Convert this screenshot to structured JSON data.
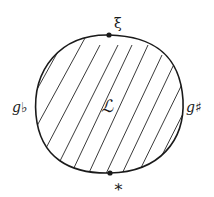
{
  "diagram": {
    "region_label": "ℒ",
    "top_point_label": "ξ",
    "bottom_point_label": "∗",
    "left_label": "g♭",
    "right_label": "g♯",
    "stroke_color": "#1a1a1a",
    "background_color": "#ffffff",
    "fill_style": "diagonal-hatching"
  }
}
